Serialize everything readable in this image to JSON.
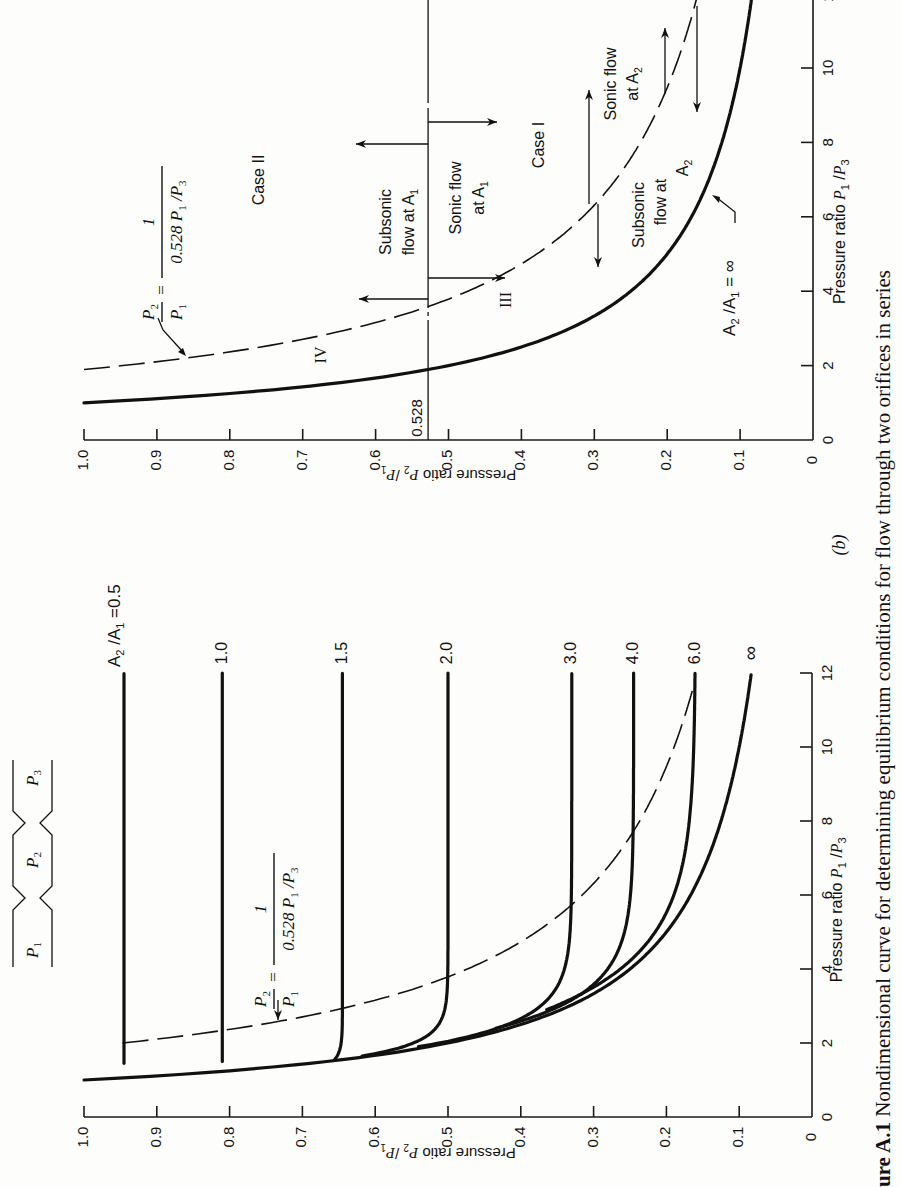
{
  "caption": {
    "label": "ure A.1",
    "text": "Nondimensional curve for determining equilibrium conditions for flow through two orifices in series"
  },
  "orifice_diagram": {
    "labels": [
      "P1",
      "P2",
      "P3"
    ]
  },
  "chart_data": [
    {
      "panel": "(a)",
      "type": "line",
      "orientation": "rotated 90° counter-clockwise",
      "xlabel": "Pressure ratio P1/P3",
      "ylabel": "Pressure ratio P2/P1",
      "xlim": [
        0,
        12
      ],
      "ylim": [
        0,
        1.0
      ],
      "xticks": [
        0,
        2,
        4,
        6,
        8,
        10,
        12
      ],
      "yticks": [
        "0",
        "0.1",
        "0.2",
        "0.3",
        "0.4",
        "0.5",
        "0.6",
        "0.7",
        "0.8",
        "0.9",
        "1.0"
      ],
      "legend_title": "A2/A1",
      "series": [
        {
          "name": "A2/A1 = 0.5",
          "label": "A2/A1 =0.5",
          "plateau": 0.945,
          "x_start": 1.45
        },
        {
          "name": "1.0",
          "label": "1.0",
          "plateau": 0.81,
          "x_start": 1.5
        },
        {
          "name": "1.5",
          "label": "1.5",
          "plateau": 0.645,
          "x_start": 1.55
        },
        {
          "name": "2.0",
          "label": "2.0",
          "plateau": 0.5,
          "x_start": 1.65
        },
        {
          "name": "3.0",
          "label": "3.0",
          "plateau": 0.33,
          "x_start": 1.9
        },
        {
          "name": "4.0",
          "label": "4.0",
          "plateau": 0.245,
          "x_start": 2.4
        },
        {
          "name": "6.0",
          "label": "6.0",
          "plateau": 0.16,
          "x_start": 2.9
        },
        {
          "name": "∞",
          "label": "∞",
          "equation": "P2/P1 = 1/(P1/P3)",
          "x_start": 1.0
        }
      ],
      "dashed_curve": {
        "equation": "P2/P1 = 1/(0.528 P1/P3)",
        "label_num": "P2",
        "label_den": "P1",
        "label_eq_num": "1",
        "label_eq_den": "0.528 P1/P3"
      }
    },
    {
      "panel": "(b)",
      "type": "line",
      "orientation": "rotated 90° counter-clockwise",
      "xlabel": "Pressure ratio P1/P3",
      "ylabel": "Pressure ratio P2/P1",
      "xlim": [
        0,
        12
      ],
      "ylim": [
        0,
        1.0
      ],
      "xticks": [
        0,
        2,
        4,
        6,
        8,
        10,
        12
      ],
      "yticks": [
        "0",
        "0.1",
        "0.2",
        "0.3",
        "0.4",
        "0.5",
        "0.6",
        "0.7",
        "0.8",
        "0.9",
        "1.0"
      ],
      "reference_line": {
        "value": 0.528,
        "label": "0.528"
      },
      "series": [
        {
          "name": "A2/A1 = ∞",
          "label": "A2/A1 = ∞",
          "equation": "P2/P1 = 1/(P1/P3)"
        },
        {
          "name": "dashed",
          "equation": "P2/P1 = 1/(0.528 P1/P3)"
        }
      ],
      "region_labels": [
        "Case II",
        "Case I",
        "III",
        "IV"
      ],
      "annotations": [
        "Subsonic flow at A1",
        "Sonic flow at A1",
        "Sonic flow at A2",
        "Subsonic flow at A2"
      ]
    }
  ],
  "text": {
    "xlabel": "Pressure ratio",
    "ylabel": "Pressure ratio",
    "panel_b": "(b)",
    "case2": "Case II",
    "case1": "Case I",
    "region3": "III",
    "region4": "IV",
    "subsonic_a1_l1": "Subsonic",
    "subsonic_a1_l2": "flow at A",
    "sonic_a1_l1": "Sonic flow",
    "sonic_a1_l2": "at A",
    "sonic_a2_l1": "Sonic flow",
    "sonic_a2_l2": "at A",
    "subsonic_a2_l1": "Subsonic",
    "subsonic_a2_l2": "flow at",
    "subsonic_a2_l3": "A",
    "ref": "0.528",
    "a2a1_inf": "= ∞",
    "a2a1_05": "=0.5"
  }
}
